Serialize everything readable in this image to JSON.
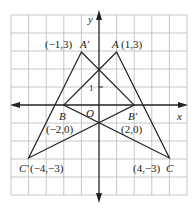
{
  "diagram": {
    "type": "coordinate-plane",
    "grid": {
      "x_min": -5,
      "x_max": 5,
      "y_min": -5,
      "y_max": 5,
      "unit_px": 17.6
    },
    "axes": {
      "x_label": "x",
      "y_label": "y",
      "origin_label": "O",
      "tick_label": "1"
    },
    "colors": {
      "line": "#222222",
      "grid": "#b8b8b8",
      "background": "#ffffff"
    },
    "points": [
      {
        "name": "A",
        "x": 1,
        "y": 3,
        "label": "A(1,3)"
      },
      {
        "name": "A'",
        "x": -1,
        "y": 3,
        "label": "(−1,3)A'"
      },
      {
        "name": "B",
        "x": -2,
        "y": 0,
        "label": "B",
        "coord_label": "(−2,0)"
      },
      {
        "name": "B'",
        "x": 2,
        "y": 0,
        "label": "B'",
        "coord_label": "(2,0)"
      },
      {
        "name": "C",
        "x": 4,
        "y": -3,
        "label": "(4,−3)C"
      },
      {
        "name": "C'",
        "x": -4,
        "y": -3,
        "label": "C'(−4,−3)"
      }
    ],
    "triangles": [
      {
        "name": "ABC",
        "vertices": [
          "A",
          "B",
          "C"
        ]
      },
      {
        "name": "A'B'C'",
        "vertices": [
          "A'",
          "B'",
          "C'"
        ]
      }
    ],
    "labels": {
      "A": "A",
      "A_coord": "(1,3)",
      "A_prime_coord": "(−1,3)",
      "A_prime": "A'",
      "B": "B",
      "B_coord": "(−2,0)",
      "B_prime": "B'",
      "B_prime_coord": "(2,0)",
      "C": "C",
      "C_coord": "(4,−3)",
      "C_prime": "C'",
      "C_prime_coord": "(−4,−3)",
      "O": "O",
      "x": "x",
      "y": "y",
      "one": "1"
    }
  }
}
